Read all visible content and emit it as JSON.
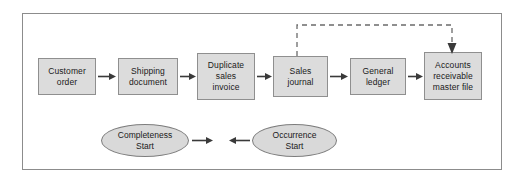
{
  "diagram": {
    "frame": {
      "border_color": "#8c8c8c",
      "background": "#ffffff"
    },
    "styles": {
      "box_fill": "#dcdcdc",
      "box_border": "#8f8f8f",
      "ellipse_fill": "#d9d9d9",
      "ellipse_border": "#7d7d7d",
      "arrow_color": "#3a3a3a",
      "dashed_color": "#6b6b6b",
      "text_color": "#1a1a1a"
    },
    "process_nodes": [
      {
        "id": "customer-order",
        "label": "Customer\norder",
        "lines": [
          "Customer",
          "order"
        ]
      },
      {
        "id": "shipping-document",
        "label": "Shipping\ndocument",
        "lines": [
          "Shipping",
          "document"
        ]
      },
      {
        "id": "duplicate-sales-invoice",
        "label": "Duplicate\nsales\ninvoice",
        "lines": [
          "Duplicate",
          "sales",
          "invoice"
        ]
      },
      {
        "id": "sales-journal",
        "label": "Sales\njournal",
        "lines": [
          "Sales",
          "journal"
        ]
      },
      {
        "id": "general-ledger",
        "label": "General\nledger",
        "lines": [
          "General",
          "ledger"
        ]
      },
      {
        "id": "accounts-receivable-master-file",
        "label": "Accounts\nreceivable\nmaster file",
        "lines": [
          "Accounts",
          "receivable",
          "master file"
        ]
      }
    ],
    "terminator_nodes": [
      {
        "id": "completeness-start",
        "label": "Completeness\nStart",
        "lines": [
          "Completeness",
          "Start"
        ]
      },
      {
        "id": "occurrence-start",
        "label": "Occurrence\nStart",
        "lines": [
          "Occurrence",
          "Start"
        ]
      }
    ],
    "connectors": [
      {
        "id": "arrow-customer-order-to-shipping-document",
        "type": "solid",
        "direction": "right"
      },
      {
        "id": "arrow-shipping-document-to-duplicate-sales-invoice",
        "type": "solid",
        "direction": "right"
      },
      {
        "id": "arrow-duplicate-sales-invoice-to-sales-journal",
        "type": "solid",
        "direction": "right"
      },
      {
        "id": "arrow-sales-journal-to-general-ledger",
        "type": "solid",
        "direction": "right"
      },
      {
        "id": "arrow-general-ledger-to-accounts-receivable",
        "type": "solid",
        "direction": "right"
      },
      {
        "id": "arrow-completeness-start-right",
        "type": "solid",
        "direction": "right"
      },
      {
        "id": "arrow-occurrence-start-left",
        "type": "solid",
        "direction": "left"
      },
      {
        "id": "dashed-sales-journal-to-accounts-receivable",
        "type": "dashed",
        "direction": "down"
      }
    ]
  }
}
